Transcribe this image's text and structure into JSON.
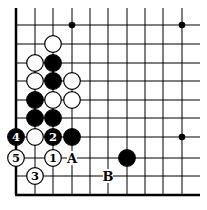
{
  "board": {
    "cols_x": [
      16,
      35,
      53,
      72,
      90,
      108,
      127,
      145,
      163,
      182
    ],
    "rows_y": [
      25,
      44,
      63,
      81,
      100,
      118,
      137,
      158,
      176
    ],
    "left_edge_x": 16,
    "bottom_edge_y": 195,
    "top_y": 8,
    "right_x": 200
  },
  "star_points": [
    {
      "col": 3,
      "row": 0
    },
    {
      "col": 9,
      "row": 0
    },
    {
      "col": 9,
      "row": 6
    }
  ],
  "stones": [
    {
      "color": "white",
      "col": 2,
      "row": 1,
      "label": ""
    },
    {
      "color": "white",
      "col": 1,
      "row": 2,
      "label": ""
    },
    {
      "color": "black",
      "col": 2,
      "row": 2,
      "label": ""
    },
    {
      "color": "white",
      "col": 1,
      "row": 3,
      "label": ""
    },
    {
      "color": "black",
      "col": 2,
      "row": 3,
      "label": ""
    },
    {
      "color": "white",
      "col": 3,
      "row": 3,
      "label": ""
    },
    {
      "color": "black",
      "col": 1,
      "row": 4,
      "label": ""
    },
    {
      "color": "white",
      "col": 2,
      "row": 4,
      "label": ""
    },
    {
      "color": "white",
      "col": 3,
      "row": 4,
      "label": ""
    },
    {
      "color": "black",
      "col": 1,
      "row": 5,
      "label": ""
    },
    {
      "color": "black",
      "col": 2,
      "row": 5,
      "label": ""
    },
    {
      "color": "black",
      "col": 0,
      "row": 6,
      "label": "4"
    },
    {
      "color": "white",
      "col": 1,
      "row": 6,
      "label": ""
    },
    {
      "color": "black",
      "col": 2,
      "row": 6,
      "label": "2"
    },
    {
      "color": "black",
      "col": 3,
      "row": 6,
      "label": ""
    },
    {
      "color": "white",
      "col": 0,
      "row": 7,
      "label": "5"
    },
    {
      "color": "white",
      "col": 2,
      "row": 7,
      "label": "1"
    },
    {
      "color": "black",
      "col": 6,
      "row": 7,
      "label": ""
    },
    {
      "color": "white",
      "col": 1,
      "row": 8,
      "label": "3"
    }
  ],
  "letters": [
    {
      "text": "A",
      "col": 3,
      "row": 7
    },
    {
      "text": "B",
      "col": 5,
      "row": 8
    }
  ]
}
